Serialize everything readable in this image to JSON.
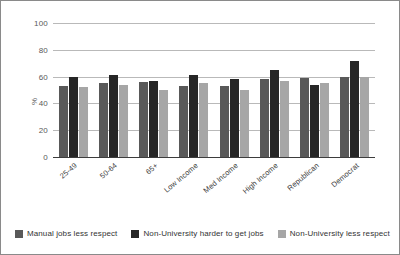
{
  "chart_data": {
    "type": "bar",
    "title": "",
    "xlabel": "",
    "ylabel": "%",
    "ylim": [
      0,
      100
    ],
    "yticks": [
      0,
      20,
      40,
      60,
      80,
      100
    ],
    "grid": true,
    "legend_position": "bottom",
    "categories": [
      "25-49",
      "50-64",
      "65+",
      "Low Income",
      "Med Income",
      "High Income",
      "Republican",
      "Democrat"
    ],
    "series": [
      {
        "name": "Manual jobs less respect",
        "color": "#595959",
        "values": [
          53,
          55,
          56,
          53,
          53,
          58,
          59,
          60
        ]
      },
      {
        "name": "Non-University harder to get jobs",
        "color": "#262626",
        "values": [
          60,
          61,
          57,
          61,
          58,
          65,
          54,
          72
        ]
      },
      {
        "name": "Non-University less respect",
        "color": "#A6A6A6",
        "values": [
          52,
          54,
          50,
          55,
          50,
          57,
          55,
          60
        ]
      }
    ]
  }
}
